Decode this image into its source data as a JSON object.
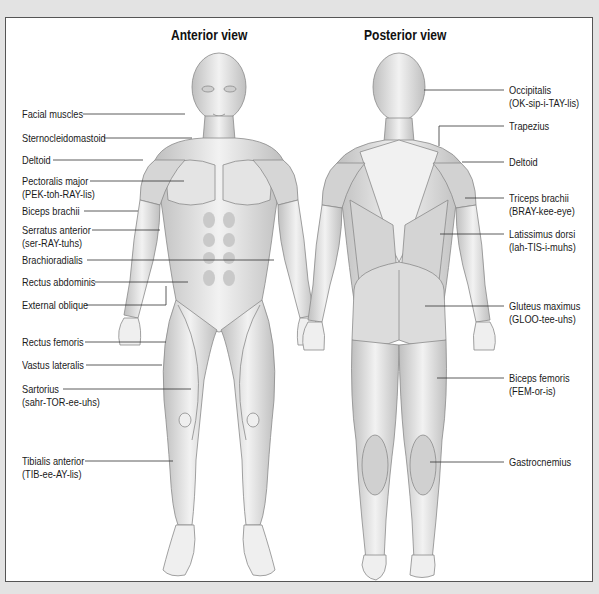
{
  "diagram": {
    "title_anterior": "Anterior view",
    "title_posterior": "Posterior view",
    "anterior_labels": [
      {
        "name": "Facial muscles",
        "pron": []
      },
      {
        "name": "Sternocleidomastoid",
        "pron": []
      },
      {
        "name": "Deltoid",
        "pron": []
      },
      {
        "name": "Pectoralis major",
        "pron": [
          [
            "PEK-",
            false
          ],
          [
            "toh",
            true
          ],
          [
            "-RAY-",
            false
          ],
          [
            "lis",
            true
          ]
        ],
        "pron_text": "(PEK-toh-RAY-lis)"
      },
      {
        "name": "Biceps brachii",
        "pron": []
      },
      {
        "name": "Serratus anterior",
        "pron": [
          [
            "ser",
            true
          ],
          [
            "-RAY-",
            false
          ],
          [
            "tuhs",
            true
          ]
        ],
        "pron_text": "(ser-RAY-tuhs)"
      },
      {
        "name": "Brachioradialis",
        "pron": []
      },
      {
        "name": "Rectus abdominis",
        "pron": []
      },
      {
        "name": "External oblique",
        "pron": []
      },
      {
        "name": "Rectus femoris",
        "pron": []
      },
      {
        "name": "Vastus lateralis",
        "pron": []
      },
      {
        "name": "Sartorius",
        "pron": [
          [
            "sahr",
            true
          ],
          [
            "-TOR-",
            false
          ],
          [
            "ee-uhs",
            true
          ]
        ],
        "pron_text": "(sahr-TOR-ee-uhs)"
      },
      {
        "name": "Tibialis anterior",
        "pron": [
          [
            "TIB-",
            false
          ],
          [
            "ee",
            true
          ],
          [
            "-AY-",
            false
          ],
          [
            "lis",
            true
          ]
        ],
        "pron_text": "(TIB-ee-AY-lis)"
      }
    ],
    "posterior_labels": [
      {
        "name": "Occipitalis",
        "pron_text": "(OK-sip-i-TAY-lis)"
      },
      {
        "name": "Trapezius",
        "pron_text": ""
      },
      {
        "name": "Deltoid",
        "pron_text": ""
      },
      {
        "name": "Triceps brachii",
        "pron_text": "(BRAY-kee-eye)"
      },
      {
        "name": "Latissimus dorsi",
        "pron_text": "(lah-TIS-i-muhs)"
      },
      {
        "name": "Gluteus maximus",
        "pron_text": "(GLOO-tee-uhs)"
      },
      {
        "name": "Biceps femoris",
        "pron_text": "(FEM-or-is)"
      },
      {
        "name": "Gastrocnemius",
        "pron_text": ""
      }
    ],
    "colors": {
      "page_background": "#e3e3e3",
      "panel_background": "#ffffff",
      "frame_border": "#555555",
      "muscle_fill": "#d9d9d9",
      "muscle_stroke": "#8a8a8a",
      "leader_line": "#333333",
      "text": "#1a1a1a"
    }
  }
}
